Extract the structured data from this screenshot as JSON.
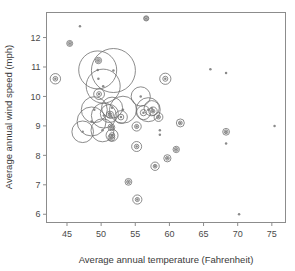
{
  "chart_data": {
    "type": "scatter",
    "title": "",
    "subtitle": "",
    "xlabel": "Average annual temperature (Fahrenheit)",
    "ylabel": "Average annual wind speed (mph)",
    "xlim": [
      42.0,
      77.0
    ],
    "ylim": [
      5.72,
      12.85
    ],
    "xticks": [
      45,
      50,
      55,
      60,
      65,
      70,
      75
    ],
    "yticks": [
      6,
      7,
      8,
      9,
      10,
      11,
      12
    ],
    "xtick_labels": [
      "45",
      "50",
      "55",
      "60",
      "65",
      "70",
      "75"
    ],
    "ytick_labels": [
      "6",
      "7",
      "8",
      "9",
      "10",
      "11",
      "12"
    ],
    "grid": false,
    "legend": "none",
    "marker_style": "dot-with-circle",
    "note": "Bubble scatter: each observation is a small grey dot, most enclosed by one or more open circles whose radius encodes an additional magnitude.",
    "points": [
      {
        "x": 56.6,
        "y": 12.65,
        "r": 2.6
      },
      {
        "x": 46.9,
        "y": 12.38,
        "r": 1.4
      },
      {
        "x": 45.4,
        "y": 11.8,
        "r": 3.0
      },
      {
        "x": 49.6,
        "y": 11.22,
        "r": 3.2
      },
      {
        "x": 49.5,
        "y": 10.9,
        "r": 19.0
      },
      {
        "x": 51.8,
        "y": 10.88,
        "r": 22.0
      },
      {
        "x": 49.6,
        "y": 10.6,
        "r": 1.6
      },
      {
        "x": 43.3,
        "y": 10.6,
        "r": 5.2
      },
      {
        "x": 59.4,
        "y": 10.6,
        "r": 5.6
      },
      {
        "x": 50.3,
        "y": 10.35,
        "r": 17.0
      },
      {
        "x": 49.7,
        "y": 10.08,
        "r": 5.4
      },
      {
        "x": 55.8,
        "y": 10.0,
        "r": 9.6
      },
      {
        "x": 51.6,
        "y": 9.62,
        "r": 10.5
      },
      {
        "x": 57.4,
        "y": 9.6,
        "r": 7.6
      },
      {
        "x": 56.9,
        "y": 9.55,
        "r": 12.0
      },
      {
        "x": 57.6,
        "y": 9.5,
        "r": 4.2
      },
      {
        "x": 51.2,
        "y": 9.42,
        "r": 9.0
      },
      {
        "x": 51.3,
        "y": 9.38,
        "r": 3.6
      },
      {
        "x": 58.4,
        "y": 9.3,
        "r": 4.4
      },
      {
        "x": 48.6,
        "y": 9.15,
        "r": 14.5
      },
      {
        "x": 61.6,
        "y": 9.1,
        "r": 4.0
      },
      {
        "x": 55.2,
        "y": 8.98,
        "r": 4.6
      },
      {
        "x": 51.5,
        "y": 8.95,
        "r": 3.4
      },
      {
        "x": 47.3,
        "y": 8.8,
        "r": 10.8
      },
      {
        "x": 68.3,
        "y": 8.8,
        "r": 3.4
      },
      {
        "x": 58.6,
        "y": 8.85,
        "r": 1.5
      },
      {
        "x": 58.6,
        "y": 8.7,
        "r": 1.5
      },
      {
        "x": 51.6,
        "y": 8.68,
        "r": 6.0
      },
      {
        "x": 51.5,
        "y": 8.6,
        "r": 3.4
      },
      {
        "x": 68.3,
        "y": 8.4,
        "r": 1.4
      },
      {
        "x": 55.2,
        "y": 8.3,
        "r": 5.0
      },
      {
        "x": 61.0,
        "y": 8.2,
        "r": 3.2
      },
      {
        "x": 59.7,
        "y": 7.9,
        "r": 3.6
      },
      {
        "x": 57.9,
        "y": 7.63,
        "r": 4.2
      },
      {
        "x": 54.0,
        "y": 7.1,
        "r": 3.4
      },
      {
        "x": 55.3,
        "y": 6.5,
        "r": 4.6
      },
      {
        "x": 66.0,
        "y": 10.92,
        "r": 1.5
      },
      {
        "x": 68.3,
        "y": 10.8,
        "r": 1.4
      },
      {
        "x": 75.4,
        "y": 9.0,
        "r": 1.5
      },
      {
        "x": 70.2,
        "y": 6.0,
        "r": 1.4
      },
      {
        "x": 50.4,
        "y": 9.35,
        "r": 12.5
      },
      {
        "x": 53.2,
        "y": 9.55,
        "r": 13.5
      },
      {
        "x": 49.0,
        "y": 9.55,
        "r": 13.0
      },
      {
        "x": 50.2,
        "y": 8.85,
        "r": 11.5
      },
      {
        "x": 52.9,
        "y": 9.3,
        "r": 6.4
      },
      {
        "x": 56.2,
        "y": 9.45,
        "r": 7.0
      }
    ]
  }
}
